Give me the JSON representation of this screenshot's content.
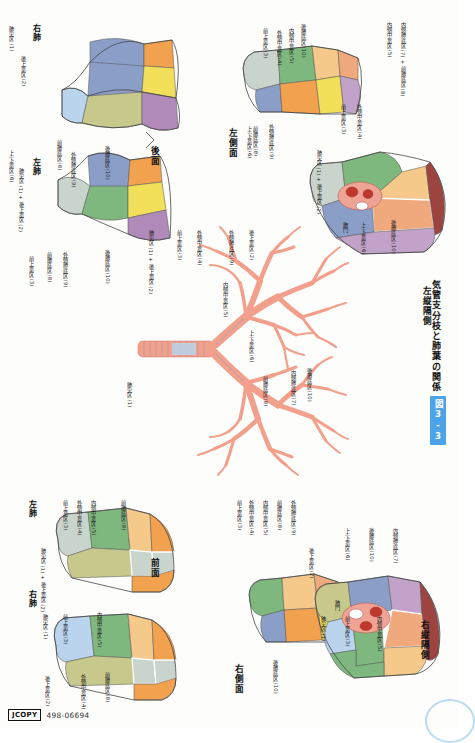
{
  "figure": {
    "badge": "図3-3",
    "title": "気管支分枝と肺葉の関係"
  },
  "footer": {
    "jcopy": "JCOPY",
    "isbn": "498-06694"
  },
  "views": {
    "posterior": {
      "name": "後面",
      "right_lung": "右肺",
      "left_lung": "左肺",
      "labels_right": [
        "肺尖区 (1)",
        "後上葉区 (2)",
        "前肺底区 (8)",
        "外側肺底区 (9)",
        "後肺底区 (10)"
      ],
      "labels_left": [
        "上-下葉区 (6)",
        "肺尖区 (1) + 後上葉区 (2)",
        "前上葉区 (3)",
        "外側肺底区 (9)",
        "前肺底区 (8)",
        "後肺底区 (10)"
      ]
    },
    "left_lateral": {
      "name": "左側面",
      "labels": [
        "上-下葉区 (6)",
        "前上葉区 (3)",
        "外側中葉区 (4)",
        "内側中葉区 (5)",
        "前肺底区 (8)",
        "外側肺底区 (9)",
        "後肺底区 (10)"
      ]
    },
    "left_mediastinal": {
      "name": "左縦隔側",
      "labels": [
        "前上葉区 (3)",
        "外側中葉区 (4)",
        "内側中葉区 (5)",
        "内側肺底区 (7) + 前肺底区 (8)",
        "肺尖区 (1) + 後上葉区 (2)",
        "肺門",
        "上-下葉区 (6)",
        "後肺底区 (10)"
      ]
    },
    "anterior": {
      "name": "前面",
      "right_lung": "右肺",
      "left_lung": "左肺",
      "labels_right": [
        "肺尖区 (1)",
        "前上葉区 (3)",
        "内側中葉区 (5)",
        "後上葉区 (2)",
        "外側中葉区 (4)",
        "前肺底区 (8)"
      ],
      "labels_left": [
        "前上葉区 (3)",
        "外側中葉区 (4)",
        "内側中葉区 (5)",
        "前肺底区 (8)",
        "肺尖区 (1) + 後上葉区 (2)"
      ]
    },
    "right_lateral": {
      "name": "右側面",
      "labels": [
        "外側中葉区 (4)",
        "内側中葉区 (5)",
        "前肺底区 (8)",
        "外側肺底区 (9)",
        "後肺底区 (10)",
        "前上葉区 (3)"
      ]
    },
    "right_mediastinal": {
      "name": "右縦隔側",
      "labels": [
        "後上葉区 (2)",
        "上-下葉区 (6)",
        "後肺底区 (10)",
        "内側肺底区 (7)",
        "肺尖区 (1)",
        "前上葉区 (3)",
        "内側中葉区 (5)",
        "肺門"
      ]
    },
    "bronchial_tree": {
      "name": "気管支樹",
      "labels": [
        "肺尖区 (1)",
        "肺尖区 (1) + 後上葉区 (2)",
        "前上葉区 (3)",
        "外側中葉区 (4)",
        "内側中葉区 (5)",
        "上-下葉区 (6)",
        "内側肺底区 (7)",
        "前肺底区 (8)",
        "外側肺底区 (9)",
        "後肺底区 (10)",
        "後上葉区 (2)"
      ]
    }
  },
  "colors": {
    "apical": "#b9d4ec",
    "posterior_upper": "#c7c98c",
    "anterior_upper": "#7fb87f",
    "lateral_middle": "#f4c98a",
    "medial_middle": "#f0a97c",
    "superior_lower": "#8a9ec8",
    "medial_basal": "#c2a2c8",
    "anterior_basal": "#f2a24e",
    "lateral_basal": "#f2e05a",
    "posterior_basal": "#b08ab8",
    "dark_red": "#9e4440",
    "hilum": "#efa394",
    "vessel": "#c0382c",
    "bronchus": "#f2a08c",
    "cartilage": "#9bb0cc",
    "accent": "#4da3e8"
  }
}
